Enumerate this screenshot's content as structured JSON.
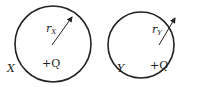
{
  "diagram": {
    "spheres": [
      {
        "name": "X",
        "label": "X",
        "charge": "+Q",
        "radius_symbol": "r",
        "radius_subscript": "X",
        "center": [
          53,
          44
        ],
        "radius_px": 38
      },
      {
        "name": "Y",
        "label": "Y",
        "charge": "+Q",
        "radius_symbol": "r",
        "radius_subscript": "Y",
        "center": [
          141,
          45
        ],
        "radius_px": 33
      }
    ],
    "colors": {
      "stroke": "#222222",
      "background": "#ffffff"
    }
  }
}
